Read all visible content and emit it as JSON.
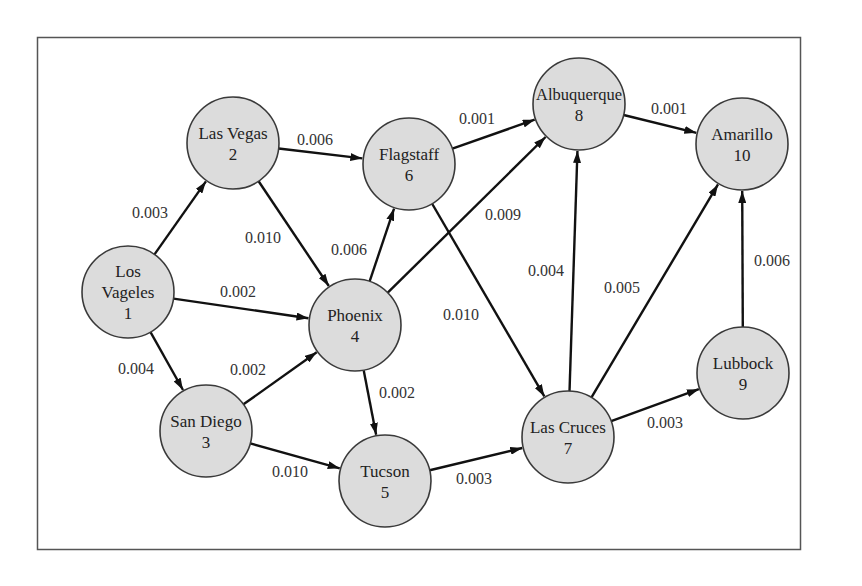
{
  "diagram": {
    "type": "directed-weighted-graph",
    "nodes": [
      {
        "id": 1,
        "name": "Los Vageles",
        "lines": [
          "Los",
          "Vageles",
          "1"
        ],
        "x": 128,
        "y": 292
      },
      {
        "id": 2,
        "name": "Las Vegas",
        "lines": [
          "Las Vegas",
          "2"
        ],
        "x": 233,
        "y": 143
      },
      {
        "id": 3,
        "name": "San Diego",
        "lines": [
          "San Diego",
          "3"
        ],
        "x": 206,
        "y": 431
      },
      {
        "id": 4,
        "name": "Phoenix",
        "lines": [
          "Phoenix",
          "4"
        ],
        "x": 355,
        "y": 325
      },
      {
        "id": 5,
        "name": "Tucson",
        "lines": [
          "Tucson",
          "5"
        ],
        "x": 385,
        "y": 481
      },
      {
        "id": 6,
        "name": "Flagstaff",
        "lines": [
          "Flagstaff",
          "6"
        ],
        "x": 409,
        "y": 164
      },
      {
        "id": 7,
        "name": "Las Cruces",
        "lines": [
          "Las Cruces",
          "7"
        ],
        "x": 568,
        "y": 437
      },
      {
        "id": 8,
        "name": "Albuquerque",
        "lines": [
          "Albuquerque",
          "8"
        ],
        "x": 579,
        "y": 104
      },
      {
        "id": 9,
        "name": "Lubbock",
        "lines": [
          "Lubbock",
          "9"
        ],
        "x": 743,
        "y": 373
      },
      {
        "id": 10,
        "name": "Amarillo",
        "lines": [
          "Amarillo",
          "10"
        ],
        "x": 742,
        "y": 144
      }
    ],
    "edges": [
      {
        "from": 1,
        "to": 2,
        "weight": "0.003",
        "lx": 150,
        "ly": 218
      },
      {
        "from": 1,
        "to": 4,
        "weight": "0.002",
        "lx": 238,
        "ly": 297
      },
      {
        "from": 1,
        "to": 3,
        "weight": "0.004",
        "lx": 136,
        "ly": 374
      },
      {
        "from": 2,
        "to": 6,
        "weight": "0.006",
        "lx": 315,
        "ly": 145
      },
      {
        "from": 2,
        "to": 4,
        "weight": "0.010",
        "lx": 263,
        "ly": 243
      },
      {
        "from": 4,
        "to": 6,
        "weight": "0.006",
        "lx": 349,
        "ly": 255
      },
      {
        "from": 4,
        "to": 8,
        "weight": "0.009",
        "lx": 503,
        "ly": 220
      },
      {
        "from": 3,
        "to": 4,
        "weight": "0.002",
        "lx": 248,
        "ly": 375
      },
      {
        "from": 4,
        "to": 5,
        "weight": "0.002",
        "lx": 397,
        "ly": 398
      },
      {
        "from": 3,
        "to": 5,
        "weight": "0.010",
        "lx": 290,
        "ly": 477
      },
      {
        "from": 6,
        "to": 8,
        "weight": "0.001",
        "lx": 477,
        "ly": 124
      },
      {
        "from": 6,
        "to": 7,
        "weight": "0.010",
        "lx": 461,
        "ly": 320
      },
      {
        "from": 5,
        "to": 7,
        "weight": "0.003",
        "lx": 474,
        "ly": 484
      },
      {
        "from": 7,
        "to": 8,
        "weight": "0.004",
        "lx": 546,
        "ly": 276
      },
      {
        "from": 7,
        "to": 10,
        "weight": "0.005",
        "lx": 622,
        "ly": 293
      },
      {
        "from": 7,
        "to": 9,
        "weight": "0.003",
        "lx": 665,
        "ly": 428
      },
      {
        "from": 8,
        "to": 10,
        "weight": "0.001",
        "lx": 669,
        "ly": 114
      },
      {
        "from": 9,
        "to": 10,
        "weight": "0.006",
        "lx": 772,
        "ly": 266
      }
    ]
  }
}
